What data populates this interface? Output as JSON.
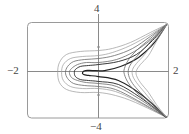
{
  "chart_data": {
    "type": "line",
    "title": "",
    "xlabel": "",
    "ylabel": "",
    "xlim": [
      -2,
      2
    ],
    "ylim": [
      -4,
      4
    ],
    "grid": false,
    "legend": null,
    "frame": "rounded box",
    "axes_through_origin": true,
    "tick_labels": {
      "x_min": "−2",
      "x_max": "2",
      "y_max": "4",
      "y_min": "−4"
    },
    "minor_ticks_y": [
      2,
      -2
    ],
    "colors": {
      "axis": "#8a8a8a",
      "frame": "#9a9a9a",
      "curve_light": "#9a9a9a",
      "curve_mid": "#6a6a6a",
      "curve_dark": "#222222"
    },
    "series": [
      {
        "name": "left-family-1",
        "shade": "light",
        "points": [
          [
            1.92,
            3.92
          ],
          [
            1.46,
            3.25
          ],
          [
            0.9,
            2.42
          ],
          [
            0.39,
            1.92
          ],
          [
            0,
            1.75
          ],
          [
            -0.51,
            1.67
          ],
          [
            -0.9,
            1.42
          ],
          [
            -1.1,
            0.75
          ],
          [
            -1.15,
            -0.08
          ],
          [
            -1.1,
            -0.92
          ],
          [
            -0.9,
            -1.5
          ],
          [
            -0.51,
            -1.75
          ],
          [
            0,
            -1.75
          ],
          [
            0.48,
            -2.0
          ],
          [
            1.04,
            -2.58
          ],
          [
            1.92,
            -3.83
          ]
        ]
      },
      {
        "name": "left-family-2",
        "shade": "light",
        "points": [
          [
            1.92,
            3.92
          ],
          [
            1.46,
            3.08
          ],
          [
            0.9,
            2.17
          ],
          [
            0.39,
            1.58
          ],
          [
            0,
            1.33
          ],
          [
            -0.45,
            1.25
          ],
          [
            -0.79,
            1.08
          ],
          [
            -0.99,
            0.58
          ],
          [
            -1.04,
            -0.08
          ],
          [
            -0.99,
            -0.75
          ],
          [
            -0.79,
            -1.25
          ],
          [
            -0.45,
            -1.42
          ],
          [
            0,
            -1.42
          ],
          [
            0.48,
            -1.67
          ],
          [
            1.04,
            -2.42
          ],
          [
            1.92,
            -3.83
          ]
        ]
      },
      {
        "name": "left-family-3",
        "shade": "mid",
        "points": [
          [
            1.92,
            3.92
          ],
          [
            1.46,
            2.92
          ],
          [
            0.96,
            1.92
          ],
          [
            0.45,
            1.33
          ],
          [
            0,
            1.08
          ],
          [
            -0.39,
            1.0
          ],
          [
            -0.7,
            0.83
          ],
          [
            -0.87,
            0.42
          ],
          [
            -0.93,
            -0.08
          ],
          [
            -0.87,
            -0.58
          ],
          [
            -0.7,
            -1.0
          ],
          [
            -0.39,
            -1.17
          ],
          [
            0,
            -1.25
          ],
          [
            0.48,
            -1.5
          ],
          [
            1.1,
            -2.42
          ],
          [
            1.92,
            -3.83
          ]
        ]
      },
      {
        "name": "left-family-4",
        "shade": "mid",
        "points": [
          [
            1.92,
            3.92
          ],
          [
            1.52,
            2.75
          ],
          [
            1.01,
            1.67
          ],
          [
            0.51,
            1.0
          ],
          [
            0,
            0.75
          ],
          [
            -0.34,
            0.75
          ],
          [
            -0.59,
            0.58
          ],
          [
            -0.76,
            0.25
          ],
          [
            -0.82,
            -0.08
          ],
          [
            -0.76,
            -0.5
          ],
          [
            -0.59,
            -0.75
          ],
          [
            -0.34,
            -0.92
          ],
          [
            0,
            -1.0
          ],
          [
            0.51,
            -1.25
          ],
          [
            1.13,
            -2.25
          ],
          [
            1.92,
            -3.83
          ]
        ]
      },
      {
        "name": "left-family-5",
        "shade": "dark",
        "points": [
          [
            1.92,
            3.92
          ],
          [
            1.52,
            2.58
          ],
          [
            1.07,
            1.42
          ],
          [
            0.56,
            0.83
          ],
          [
            0,
            0.58
          ],
          [
            -0.28,
            0.5
          ],
          [
            -0.51,
            0.42
          ],
          [
            -0.65,
            0.17
          ],
          [
            -0.68,
            -0.08
          ],
          [
            -0.65,
            -0.42
          ],
          [
            -0.51,
            -0.67
          ],
          [
            -0.28,
            -0.75
          ],
          [
            0,
            -0.83
          ],
          [
            0.56,
            -1.08
          ],
          [
            1.18,
            -2.17
          ],
          [
            1.92,
            -3.83
          ]
        ]
      },
      {
        "name": "left-family-6",
        "shade": "darkest",
        "points": [
          [
            1.92,
            3.92
          ],
          [
            1.58,
            2.42
          ],
          [
            1.13,
            1.17
          ],
          [
            0.62,
            0.42
          ],
          [
            0.17,
            0.08
          ],
          [
            -0.17,
            0.08
          ],
          [
            -0.37,
            0.08
          ],
          [
            -0.45,
            -0.08
          ],
          [
            -0.42,
            -0.25
          ],
          [
            -0.28,
            -0.33
          ],
          [
            0,
            -0.42
          ],
          [
            0.56,
            -0.75
          ],
          [
            1.24,
            -2.0
          ],
          [
            1.92,
            -3.83
          ]
        ]
      },
      {
        "name": "right-family-1",
        "shade": "mid",
        "points": [
          [
            1.92,
            3.92
          ],
          [
            1.46,
            2.75
          ],
          [
            1.07,
            1.75
          ],
          [
            0.85,
            1.0
          ],
          [
            0.73,
            0.25
          ],
          [
            0.73,
            -0.25
          ],
          [
            0.85,
            -1.0
          ],
          [
            1.07,
            -1.75
          ],
          [
            1.46,
            -2.75
          ],
          [
            1.92,
            -3.83
          ]
        ]
      },
      {
        "name": "right-family-2",
        "shade": "mid",
        "points": [
          [
            1.92,
            3.92
          ],
          [
            1.52,
            2.67
          ],
          [
            1.18,
            1.58
          ],
          [
            0.96,
            0.83
          ],
          [
            0.85,
            0.25
          ],
          [
            0.85,
            -0.33
          ],
          [
            0.96,
            -1.0
          ],
          [
            1.18,
            -1.75
          ],
          [
            1.52,
            -2.75
          ],
          [
            1.92,
            -3.83
          ]
        ]
      },
      {
        "name": "right-family-3",
        "shade": "light",
        "points": [
          [
            1.92,
            3.92
          ],
          [
            1.58,
            2.58
          ],
          [
            1.3,
            1.42
          ],
          [
            1.07,
            0.67
          ],
          [
            0.96,
            0.17
          ],
          [
            0.96,
            -0.33
          ],
          [
            1.07,
            -0.92
          ],
          [
            1.3,
            -1.75
          ],
          [
            1.58,
            -2.75
          ],
          [
            1.92,
            -3.83
          ]
        ]
      },
      {
        "name": "right-family-4",
        "shade": "light",
        "points": [
          [
            1.92,
            3.92
          ],
          [
            1.63,
            2.5
          ],
          [
            1.41,
            1.33
          ],
          [
            1.18,
            0.58
          ],
          [
            1.07,
            0.08
          ],
          [
            1.07,
            -0.33
          ],
          [
            1.18,
            -0.92
          ],
          [
            1.41,
            -1.75
          ],
          [
            1.63,
            -2.75
          ],
          [
            1.92,
            -3.83
          ]
        ]
      }
    ]
  }
}
